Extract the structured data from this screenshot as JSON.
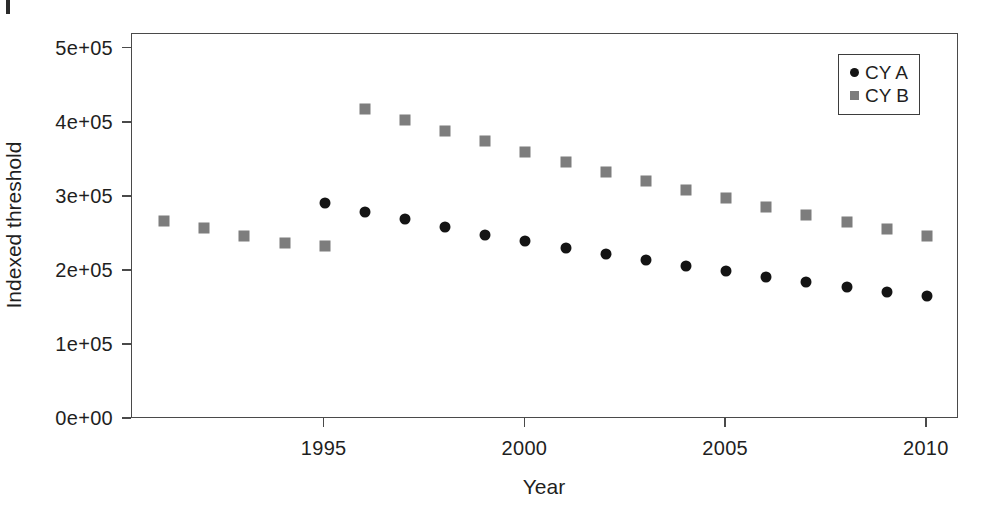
{
  "chart_data": {
    "type": "scatter",
    "title": "",
    "xlabel": "Year",
    "ylabel": "Indexed threshold",
    "xlim": [
      1990.2,
      2010.8
    ],
    "ylim": [
      0,
      520000
    ],
    "grid": false,
    "legend_position": "top-right",
    "x_ticks": [
      1995,
      2000,
      2005,
      2010
    ],
    "x_tick_labels": [
      "1995",
      "2000",
      "2005",
      "2010"
    ],
    "y_ticks": [
      0,
      100000,
      200000,
      300000,
      400000,
      500000
    ],
    "y_tick_labels": [
      "0e+00",
      "1e+05",
      "2e+05",
      "3e+05",
      "4e+05",
      "5e+05"
    ],
    "x": [
      1991,
      1992,
      1993,
      1994,
      1995,
      1996,
      1997,
      1998,
      1999,
      2000,
      2001,
      2002,
      2003,
      2004,
      2005,
      2006,
      2007,
      2008,
      2009,
      2010
    ],
    "series": [
      {
        "name": "CY A",
        "marker": "circle",
        "color": "#141414",
        "x": [
          1995,
          1996,
          1997,
          1998,
          1999,
          2000,
          2001,
          2002,
          2003,
          2004,
          2005,
          2006,
          2007,
          2008,
          2009,
          2010
        ],
        "values": [
          292000,
          280000,
          270000,
          259000,
          249000,
          240000,
          231000,
          223000,
          215000,
          207000,
          200000,
          192000,
          185000,
          178000,
          172000,
          166000
        ]
      },
      {
        "name": "CY B",
        "marker": "square",
        "color": "#7d7d7d",
        "x": [
          1991,
          1992,
          1993,
          1994,
          1995,
          1996,
          1997,
          1998,
          1999,
          2000,
          2001,
          2002,
          2003,
          2004,
          2005,
          2006,
          2007,
          2008,
          2009,
          2010
        ],
        "values": [
          268000,
          258000,
          247000,
          238000,
          233000,
          419000,
          404000,
          389000,
          375000,
          361000,
          347000,
          334000,
          321000,
          309000,
          298000,
          287000,
          276000,
          266000,
          256000,
          247000
        ]
      }
    ]
  },
  "legend": {
    "entries": [
      {
        "label": "CY A",
        "marker": "circle"
      },
      {
        "label": "CY B",
        "marker": "square"
      }
    ]
  },
  "axes": {
    "x_label": "Year",
    "y_label": "Indexed threshold"
  },
  "colors": {
    "series_a": "#141414",
    "series_b": "#7d7d7d",
    "frame": "#4a4a4a",
    "background": "#ffffff"
  }
}
